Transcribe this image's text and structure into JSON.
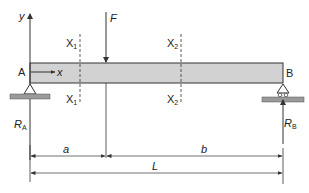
{
  "diagram": {
    "labels": {
      "y_axis": "y",
      "x_axis": "x",
      "force": "F",
      "point_a": "A",
      "point_b": "B",
      "section1_top": "X",
      "section1_bottom": "X",
      "section1_sub": "1",
      "section2_top": "X",
      "section2_bottom": "X",
      "section2_sub": "2",
      "reaction_a": "R",
      "reaction_a_sub": "A",
      "reaction_b": "R",
      "reaction_b_sub": "B",
      "dim_a": "a",
      "dim_b": "b",
      "dim_L": "L"
    },
    "colors": {
      "beam_fill": "#d2d2d2",
      "ground_fill": "#9a9a9a",
      "line": "#333333"
    }
  }
}
